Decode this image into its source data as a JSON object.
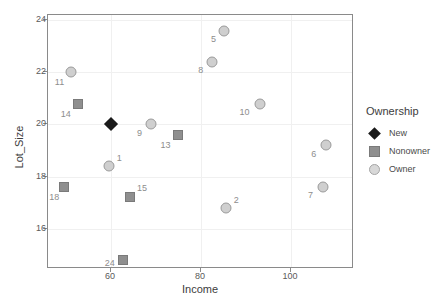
{
  "chart_data": {
    "type": "scatter",
    "title": "",
    "xlabel": "Income",
    "ylabel": "Lot_Size",
    "xlim": [
      46,
      114
    ],
    "ylim": [
      14.45,
      24.2
    ],
    "xticks": [
      60,
      80,
      100
    ],
    "yticks": [
      16,
      18,
      20,
      22,
      24
    ],
    "xticklabels": [
      "60",
      "80",
      "100"
    ],
    "yticklabels": [
      "16",
      "18",
      "20",
      "22",
      "24"
    ],
    "grid": true,
    "legend": {
      "title": "Ownership",
      "position": "right",
      "entries": [
        {
          "label": "New",
          "marker": "diamond",
          "color": "#1a1a1a"
        },
        {
          "label": "Nonowner",
          "marker": "square",
          "color": "#8f8f8f"
        },
        {
          "label": "Owner",
          "marker": "circle",
          "color": "#d0d0d0"
        }
      ]
    },
    "series": [
      {
        "name": "Owner",
        "marker": "circle",
        "color": "#d0d0d0",
        "points": [
          {
            "label": "11",
            "x": 51.0,
            "y": 22.0,
            "label_dx": -11,
            "label_dy": 10
          },
          {
            "label": "5",
            "x": 85.2,
            "y": 23.6,
            "label_dx": -11,
            "label_dy": 8
          },
          {
            "label": "8",
            "x": 82.4,
            "y": 22.4,
            "label_dx": -11,
            "label_dy": 8
          },
          {
            "label": "9",
            "x": 68.8,
            "y": 20.0,
            "label_dx": -11,
            "label_dy": 9
          },
          {
            "label": "10",
            "x": 93.0,
            "y": 20.8,
            "label_dx": -15,
            "label_dy": 8
          },
          {
            "label": "6",
            "x": 107.7,
            "y": 19.2,
            "label_dx": -12,
            "label_dy": 9
          },
          {
            "label": "1",
            "x": 59.6,
            "y": 18.4,
            "label_dx": 10,
            "label_dy": -8
          },
          {
            "label": "7",
            "x": 107.0,
            "y": 17.6,
            "label_dx": -12,
            "label_dy": 8
          },
          {
            "label": "2",
            "x": 85.6,
            "y": 16.8,
            "label_dx": 10,
            "label_dy": -8
          }
        ]
      },
      {
        "name": "Nonowner",
        "marker": "square",
        "color": "#8f8f8f",
        "points": [
          {
            "label": "14",
            "x": 52.6,
            "y": 20.8,
            "label_dx": -12,
            "label_dy": 10
          },
          {
            "label": "13",
            "x": 74.8,
            "y": 19.6,
            "label_dx": -12,
            "label_dy": 10
          },
          {
            "label": "18",
            "x": 49.6,
            "y": 17.6,
            "label_dx": -10,
            "label_dy": 10
          },
          {
            "label": "15",
            "x": 64.2,
            "y": 17.2,
            "label_dx": 12,
            "label_dy": -9
          },
          {
            "label": "24",
            "x": 62.6,
            "y": 14.8,
            "label_dx": -13,
            "label_dy": 3
          }
        ]
      },
      {
        "name": "New",
        "marker": "diamond",
        "color": "#1a1a1a",
        "points": [
          {
            "label": "",
            "x": 60.0,
            "y": 20.0,
            "label_dx": 0,
            "label_dy": 0
          }
        ]
      }
    ]
  }
}
